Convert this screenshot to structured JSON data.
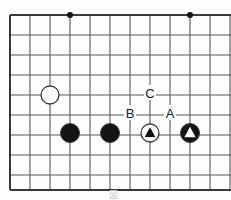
{
  "figure": {
    "kind": "go-board-diagram",
    "caption": "図",
    "background_color": "#fefefe"
  },
  "board": {
    "line_color": "#555555",
    "border_color": "#3a3a3a",
    "grid_spacing": 20,
    "origin_x": 10,
    "origin_y": 15,
    "columns": 12,
    "rows": 10,
    "left_edge_x": 10,
    "right_edge_x": 231,
    "top_edge_y": 15,
    "bottom_edge_y": 190,
    "star_points": [
      {
        "name": "star-point-left",
        "x": 70,
        "y": 15,
        "radius": 3
      },
      {
        "name": "star-point-right",
        "x": 190,
        "y": 15,
        "radius": 3
      }
    ]
  },
  "stones": [
    {
      "name": "white-stone-1",
      "color": "white",
      "x": 50,
      "y": 95,
      "radius": 9,
      "marker": "none"
    },
    {
      "name": "black-stone-1",
      "color": "black",
      "x": 70,
      "y": 133,
      "radius": 9.5,
      "marker": "none"
    },
    {
      "name": "black-stone-2",
      "color": "black",
      "x": 110,
      "y": 133,
      "radius": 9.5,
      "marker": "none"
    },
    {
      "name": "white-stone-triangle",
      "color": "white",
      "x": 150,
      "y": 133,
      "radius": 9,
      "marker": "triangle",
      "marker_color": "#111111"
    },
    {
      "name": "black-stone-triangle",
      "color": "black",
      "x": 190,
      "y": 133,
      "radius": 9.5,
      "marker": "triangle",
      "marker_color": "#ffffff"
    }
  ],
  "point_labels": [
    {
      "name": "label-c",
      "text": "C",
      "x": 150,
      "y": 93,
      "color": "#1a1a1a",
      "font_size": 13
    },
    {
      "name": "label-b",
      "text": "B",
      "x": 130,
      "y": 113,
      "color": "#1a1a1a",
      "font_size": 13
    },
    {
      "name": "label-a",
      "text": "A",
      "x": 170,
      "y": 113,
      "color": "#1a1a1a",
      "font_size": 13
    }
  ],
  "colors": {
    "stone_black": "#141414",
    "stone_white": "#ffffff",
    "stone_outline": "#3a3a3a",
    "grid": "#555555",
    "border": "#3a3a3a",
    "label_text": "#1a1a1a"
  }
}
